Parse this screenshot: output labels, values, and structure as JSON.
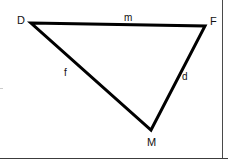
{
  "figure": {
    "type": "geometry-triangle",
    "background_color": "#ffffff",
    "stroke_color": "#000000",
    "stroke_width": 3,
    "vertices": [
      {
        "name": "D",
        "label": "D",
        "x": 31,
        "y": 23,
        "label_x": 17,
        "label_y": 15
      },
      {
        "name": "F",
        "label": "F",
        "x": 205,
        "y": 26,
        "label_x": 210,
        "label_y": 16
      },
      {
        "name": "M",
        "label": "M",
        "x": 151,
        "y": 130,
        "label_x": 147,
        "label_y": 137
      }
    ],
    "sides": [
      {
        "name": "side-df",
        "label": "m",
        "from": "D",
        "to": "F",
        "label_x": 124,
        "label_y": 12
      },
      {
        "name": "side-dm",
        "label": "f",
        "from": "D",
        "to": "M",
        "label_x": 64,
        "label_y": 67
      },
      {
        "name": "side-mf",
        "label": "d",
        "from": "M",
        "to": "F",
        "label_x": 182,
        "label_y": 71
      }
    ],
    "polygon_points": "31,23 205,26 151,130"
  },
  "chart_data": {
    "type": "diagram",
    "points": {
      "D": [
        31,
        23
      ],
      "F": [
        205,
        26
      ],
      "M": [
        151,
        130
      ]
    },
    "edge_labels": {
      "DF": "m",
      "DM": "f",
      "MF": "d"
    }
  }
}
